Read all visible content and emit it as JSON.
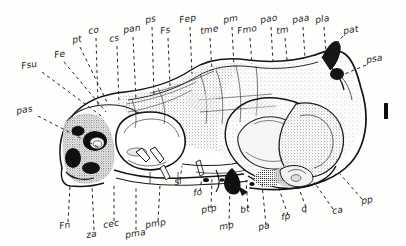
{
  "figure": {
    "kind": "anatomical-line-drawing",
    "style": "stippled ink drawing with dashed leader lines",
    "background_color": "#fefefd",
    "ink_color": "#1b1b1b",
    "scale_bar": {
      "name": "scale-bar",
      "orientation": "vertical",
      "caption": ""
    }
  },
  "labels_top": [
    {
      "id": "fsu",
      "text": "Fsu",
      "x": 22,
      "y": 68,
      "tilt": "tilt"
    },
    {
      "id": "fe",
      "text": "Fe",
      "x": 55,
      "y": 57,
      "tilt": "tilt"
    },
    {
      "id": "pt",
      "text": "pt",
      "x": 73,
      "y": 42,
      "tilt": "tilt"
    },
    {
      "id": "co",
      "text": "co",
      "x": 91,
      "y": 33,
      "tilt": "tilt"
    },
    {
      "id": "cs",
      "text": "cs",
      "x": 111,
      "y": 41,
      "tilt": "tilt"
    },
    {
      "id": "pan",
      "text": "pan",
      "x": 126,
      "y": 32,
      "tilt": "tilt"
    },
    {
      "id": "ps",
      "text": "ps",
      "x": 147,
      "y": 22,
      "tilt": "tilt"
    },
    {
      "id": "fs",
      "text": "Fs",
      "x": 162,
      "y": 33,
      "tilt": "tilt"
    },
    {
      "id": "fep",
      "text": "Fep",
      "x": 183,
      "y": 22,
      "tilt": "tilt"
    },
    {
      "id": "tme",
      "text": "tme",
      "x": 203,
      "y": 33,
      "tilt": "tilt"
    },
    {
      "id": "pm",
      "text": "pm",
      "x": 226,
      "y": 22,
      "tilt": "tilt"
    },
    {
      "id": "fmo",
      "text": "Fmo",
      "x": 240,
      "y": 33,
      "tilt": "tilt"
    },
    {
      "id": "pao",
      "text": "pao",
      "x": 264,
      "y": 22,
      "tilt": "tilt"
    },
    {
      "id": "tm",
      "text": "tm",
      "x": 278,
      "y": 33,
      "tilt": "tilt"
    },
    {
      "id": "paa",
      "text": "paa",
      "x": 296,
      "y": 22,
      "tilt": "tilt"
    },
    {
      "id": "pla",
      "text": "pla",
      "x": 318,
      "y": 22,
      "tilt": "tilt"
    },
    {
      "id": "pat",
      "text": "pat",
      "x": 345,
      "y": 33,
      "tilt": "tilt"
    },
    {
      "id": "psa",
      "text": "psa",
      "x": 368,
      "y": 62,
      "tilt": "tilt"
    },
    {
      "id": "pas",
      "text": "pas",
      "x": 18,
      "y": 113,
      "tilt": "tilt"
    }
  ],
  "labels_bottom": [
    {
      "id": "fn",
      "text": "Fn",
      "x": 62,
      "y": 228,
      "tilt": "tilt"
    },
    {
      "id": "za",
      "text": "za",
      "x": 88,
      "y": 236,
      "tilt": "tilt"
    },
    {
      "id": "cec",
      "text": "cec",
      "x": 106,
      "y": 227,
      "tilt": "tilt"
    },
    {
      "id": "pma",
      "text": "pma",
      "x": 128,
      "y": 236,
      "tilt": "tilt"
    },
    {
      "id": "pmp",
      "text": "pmp",
      "x": 148,
      "y": 227,
      "tilt": "tilt"
    },
    {
      "id": "si",
      "text": "si",
      "x": 176,
      "y": 185,
      "tilt": "tilt"
    },
    {
      "id": "fo",
      "text": "fo",
      "x": 196,
      "y": 197,
      "tilt": "tilt"
    },
    {
      "id": "ptp",
      "text": "ptp",
      "x": 204,
      "y": 214,
      "tilt": "tilt"
    },
    {
      "id": "mp",
      "text": "mp",
      "x": 222,
      "y": 231,
      "tilt": "tilt"
    },
    {
      "id": "bt",
      "text": "bt",
      "x": 243,
      "y": 214,
      "tilt": "tilt"
    },
    {
      "id": "pa",
      "text": "pa",
      "x": 261,
      "y": 231,
      "tilt": "tilt"
    },
    {
      "id": "fp",
      "text": "fp",
      "x": 284,
      "y": 221,
      "tilt": "tilt"
    },
    {
      "id": "q",
      "text": "q",
      "x": 303,
      "y": 213,
      "tilt": "tilt"
    },
    {
      "id": "ca",
      "text": "ca",
      "x": 335,
      "y": 215,
      "tilt": "tilt"
    },
    {
      "id": "pp",
      "text": "pp",
      "x": 364,
      "y": 205,
      "tilt": "tilt"
    }
  ]
}
